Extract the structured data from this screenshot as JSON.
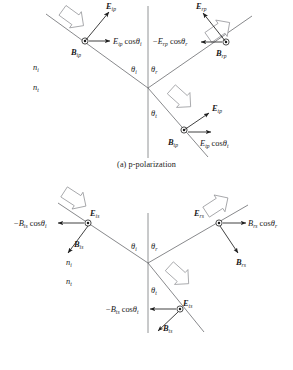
{
  "figure": {
    "panels": [
      {
        "id": "a",
        "caption": "(a) p-polarization",
        "media": {
          "incident_index": "n",
          "incident_sub": "i",
          "transmitted_index": "n",
          "transmitted_sub": "t"
        },
        "angles": [
          {
            "name": "angle-incidence",
            "symbol": "θ",
            "sub": "i"
          },
          {
            "name": "angle-reflection",
            "symbol": "θ",
            "sub": "r"
          },
          {
            "name": "angle-transmission",
            "symbol": "θ",
            "sub": "t"
          }
        ],
        "labels": {
          "incident_E": {
            "sym": "E",
            "sub": "ip"
          },
          "incident_B": {
            "sym": "B",
            "sub": "ip"
          },
          "incident_component": {
            "sym": "E",
            "sub": "ip",
            "tail": "cosθ",
            "tail_sub": "i",
            "sign": ""
          },
          "reflected_E": {
            "sym": "E",
            "sub": "rp"
          },
          "reflected_B": {
            "sym": "B",
            "sub": "rp"
          },
          "reflected_component": {
            "sym": "E",
            "sub": "rp",
            "tail": "cosθ",
            "tail_sub": "r",
            "sign": "−"
          },
          "transmitted_E": {
            "sym": "E",
            "sub": "tp"
          },
          "transmitted_B": {
            "sym": "B",
            "sub": "tp"
          },
          "transmitted_component": {
            "sym": "E",
            "sub": "tp",
            "tail": "cosθ",
            "tail_sub": "t",
            "sign": ""
          }
        },
        "out_of_page_vectors": [
          "B ip",
          "B rp",
          "B tp"
        ]
      },
      {
        "id": "b",
        "caption": "(b) s-polarization",
        "media": {
          "incident_index": "n",
          "incident_sub": "i",
          "transmitted_index": "n",
          "transmitted_sub": "t"
        },
        "angles": [
          {
            "name": "angle-incidence",
            "symbol": "θ",
            "sub": "i"
          },
          {
            "name": "angle-reflection",
            "symbol": "θ",
            "sub": "r"
          },
          {
            "name": "angle-transmission",
            "symbol": "θ",
            "sub": "t"
          }
        ],
        "labels": {
          "incident_E": {
            "sym": "E",
            "sub": "is"
          },
          "incident_B": {
            "sym": "B",
            "sub": "is"
          },
          "incident_component": {
            "sym": "B",
            "sub": "is",
            "tail": "cosθ",
            "tail_sub": "i",
            "sign": "−"
          },
          "reflected_E": {
            "sym": "E",
            "sub": "rs"
          },
          "reflected_B": {
            "sym": "B",
            "sub": "rs"
          },
          "reflected_component": {
            "sym": "B",
            "sub": "rs",
            "tail": "cosθ",
            "tail_sub": "r",
            "sign": ""
          },
          "transmitted_E": {
            "sym": "E",
            "sub": "ts"
          },
          "transmitted_B": {
            "sym": "B",
            "sub": "ts"
          },
          "transmitted_component": {
            "sym": "B",
            "sub": "ts",
            "tail": "cosθ",
            "tail_sub": "t",
            "sign": "−"
          }
        },
        "out_of_page_vectors": [
          "E is",
          "E rs",
          "E ts"
        ]
      }
    ],
    "colors": {
      "ray": "#55565a",
      "normal": "#77787c",
      "vector": "#1f1f1f",
      "block_arrow_outline": "#8e8f93",
      "text": "#1a1a1a",
      "background": "#ffffff"
    }
  }
}
